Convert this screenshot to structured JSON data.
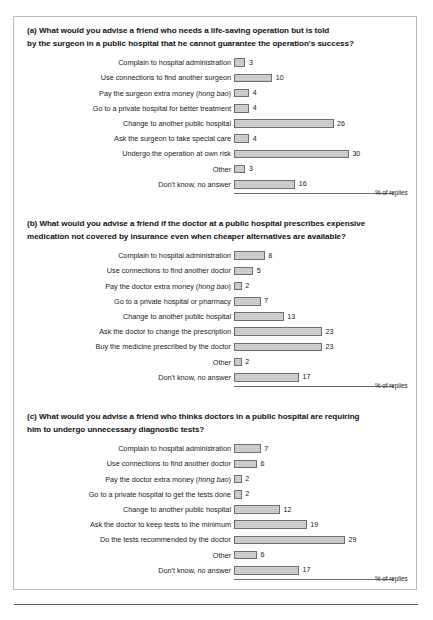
{
  "figure": {
    "axis_caption": "% of replies",
    "bar_fill_color": "#d0d0d0",
    "bar_border_color": "#6d6d6d",
    "frame_color": "#b9b9b9"
  },
  "chart_data": [
    {
      "type": "bar",
      "orientation": "horizontal",
      "tag": "(a)",
      "title": "What would you advise a friend who needs a life-saving operation but is told by the surgeon in a public hospital that he cannot guarantee the operation's success?",
      "title_line1": "(a)  What would you advise a friend who needs a life-saving operation but is told",
      "title_line2": "by the surgeon in a public hospital that he cannot guarantee the operation's success?",
      "xlabel": "% of replies",
      "ylabel": "",
      "xlim": [
        0,
        32
      ],
      "grid": false,
      "legend": "none",
      "categories": [
        "Complain to hospital administration",
        "Use connections to find another surgeon",
        "Pay the surgeon extra money (hong bao)",
        "Go to a private hospital for better treatment",
        "Change to another public hospital",
        "Ask the surgeon to take special care",
        "Undergo the operation at own risk",
        "Other",
        "Don't know, no answer"
      ],
      "values": [
        3,
        10,
        4,
        4,
        26,
        4,
        30,
        3,
        16
      ]
    },
    {
      "type": "bar",
      "orientation": "horizontal",
      "tag": "(b)",
      "title": "What would you advise a friend if the doctor at a public hospital prescribes expensive medication not covered by insurance even when cheaper alternatives are available?",
      "title_line1": "(b)  What would you advise a friend if the doctor at a public hospital prescribes expensive",
      "title_line2": "medication not covered by insurance even when cheaper alternatives are available?",
      "xlabel": "% of replies",
      "ylabel": "",
      "xlim": [
        0,
        32
      ],
      "grid": false,
      "legend": "none",
      "categories": [
        "Complain to hospital administration",
        "Use connections to find another doctor",
        "Pay the doctor extra money (hong bao)",
        "Go to a private hospital or pharmacy",
        "Change to another public hospital",
        "Ask the doctor to change the prescription",
        "Buy the medicine prescribed by the doctor",
        "Other",
        "Don't know, no answer"
      ],
      "values": [
        8,
        5,
        2,
        7,
        13,
        23,
        23,
        2,
        17
      ]
    },
    {
      "type": "bar",
      "orientation": "horizontal",
      "tag": "(c)",
      "title": "What would you advise a friend who thinks doctors in a public hospital are requiring him to undergo unnecessary diagnostic tests?",
      "title_line1": "(c)  What would you advise a friend who thinks doctors in a public hospital are requiring",
      "title_line2": "him to undergo unnecessary diagnostic tests?",
      "xlabel": "% of replies",
      "ylabel": "",
      "xlim": [
        0,
        32
      ],
      "grid": false,
      "legend": "none",
      "categories": [
        "Complain to hospital administration",
        "Use connections to find another doctor",
        "Pay the doctor extra money (hong bao)",
        "Go to a private hospital to get the tests done",
        "Change to another public hospital",
        "Ask the doctor to keep tests to the minimum",
        "Do the tests recommended by the doctor",
        "Other",
        "Don't know, no answer"
      ],
      "values": [
        7,
        6,
        2,
        2,
        12,
        19,
        29,
        6,
        17
      ]
    }
  ]
}
